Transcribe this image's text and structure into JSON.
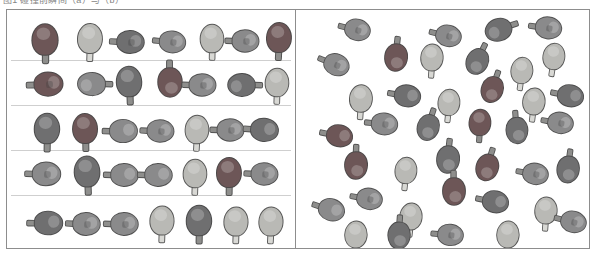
{
  "figure": {
    "caption": "图1  碰撞前瞬间（a）与（b）",
    "frame_color": "#8d8d8d",
    "background": "#ffffff",
    "row_rule_color": "#cfcfcf"
  },
  "palette": {
    "dark_maroon": "#6d5657",
    "dark_gray": "#6f6f70",
    "mid_gray": "#8a8a8b",
    "light_gray": "#b9b9b5",
    "pale_cream": "#c6c6c0",
    "handle_light": "#d8d8d4",
    "handle_dark": "#8e8e8c",
    "outline": "#464646"
  },
  "panels": [
    {
      "id": "ordered",
      "name": "ordered-arrangement-panel",
      "label": "a",
      "description": "paddles aligned in five horizontal rows",
      "row_count": 5,
      "row_rule_y": [
        50,
        95,
        140,
        185
      ],
      "paddle_count": 34,
      "paddles": [
        {
          "x": 38,
          "y": 29,
          "r": 0,
          "s": 1.05,
          "blade": "dark_maroon",
          "handle": "handle_dark",
          "logo": false
        },
        {
          "x": 83,
          "y": 28,
          "r": 2,
          "s": 1.0,
          "blade": "light_gray",
          "handle": "handle_light",
          "logo": false
        },
        {
          "x": 124,
          "y": 32,
          "r": 93,
          "s": 0.92,
          "blade": "dark_gray",
          "handle": "handle_dark",
          "logo": true
        },
        {
          "x": 166,
          "y": 32,
          "r": 96,
          "s": 0.88,
          "blade": "mid_gray",
          "handle": "handle_dark",
          "logo": true
        },
        {
          "x": 205,
          "y": 28,
          "r": 1,
          "s": 0.95,
          "blade": "light_gray",
          "handle": "handle_light",
          "logo": false
        },
        {
          "x": 239,
          "y": 31,
          "r": 92,
          "s": 0.9,
          "blade": "mid_gray",
          "handle": "handle_dark",
          "logo": true
        },
        {
          "x": 272,
          "y": 27,
          "r": 3,
          "s": 1.0,
          "blade": "dark_maroon",
          "handle": "handle_dark",
          "logo": false
        },
        {
          "x": 42,
          "y": 74,
          "r": 88,
          "s": 0.97,
          "blade": "dark_maroon",
          "handle": "handle_dark",
          "logo": true
        },
        {
          "x": 84,
          "y": 74,
          "r": 272,
          "s": 0.93,
          "blade": "mid_gray",
          "handle": "handle_dark",
          "logo": false
        },
        {
          "x": 122,
          "y": 71,
          "r": 358,
          "s": 1.02,
          "blade": "dark_gray",
          "handle": "handle_dark",
          "logo": false
        },
        {
          "x": 163,
          "y": 73,
          "r": 180,
          "s": 0.98,
          "blade": "dark_maroon",
          "handle": "handle_dark",
          "logo": false
        },
        {
          "x": 196,
          "y": 75,
          "r": 92,
          "s": 0.9,
          "blade": "mid_gray",
          "handle": "handle_dark",
          "logo": true
        },
        {
          "x": 234,
          "y": 75,
          "r": 272,
          "s": 0.92,
          "blade": "dark_gray",
          "handle": "handle_dark",
          "logo": false
        },
        {
          "x": 270,
          "y": 72,
          "r": 2,
          "s": 0.95,
          "blade": "light_gray",
          "handle": "handle_light",
          "logo": false
        },
        {
          "x": 40,
          "y": 118,
          "r": 1,
          "s": 1.02,
          "blade": "dark_gray",
          "handle": "handle_dark",
          "logo": false
        },
        {
          "x": 78,
          "y": 118,
          "r": 359,
          "s": 1.0,
          "blade": "dark_maroon",
          "handle": "handle_dark",
          "logo": false
        },
        {
          "x": 117,
          "y": 121,
          "r": 91,
          "s": 0.93,
          "blade": "mid_gray",
          "handle": "handle_dark",
          "logo": false
        },
        {
          "x": 154,
          "y": 121,
          "r": 93,
          "s": 0.9,
          "blade": "mid_gray",
          "handle": "handle_dark",
          "logo": true
        },
        {
          "x": 190,
          "y": 119,
          "r": 3,
          "s": 0.95,
          "blade": "light_gray",
          "handle": "handle_light",
          "logo": false
        },
        {
          "x": 224,
          "y": 120,
          "r": 92,
          "s": 0.9,
          "blade": "mid_gray",
          "handle": "handle_dark",
          "logo": true
        },
        {
          "x": 258,
          "y": 120,
          "r": 95,
          "s": 0.93,
          "blade": "dark_gray",
          "handle": "handle_dark",
          "logo": false
        },
        {
          "x": 40,
          "y": 164,
          "r": 92,
          "s": 0.95,
          "blade": "mid_gray",
          "handle": "handle_dark",
          "logo": true
        },
        {
          "x": 80,
          "y": 161,
          "r": 358,
          "s": 1.03,
          "blade": "dark_gray",
          "handle": "handle_dark",
          "logo": false
        },
        {
          "x": 118,
          "y": 165,
          "r": 92,
          "s": 0.92,
          "blade": "mid_gray",
          "handle": "handle_dark",
          "logo": false
        },
        {
          "x": 152,
          "y": 165,
          "r": 92,
          "s": 0.92,
          "blade": "mid_gray",
          "handle": "handle_dark",
          "logo": false
        },
        {
          "x": 188,
          "y": 163,
          "r": 2,
          "s": 0.95,
          "blade": "light_gray",
          "handle": "handle_light",
          "logo": false
        },
        {
          "x": 222,
          "y": 162,
          "r": 1,
          "s": 1.0,
          "blade": "dark_maroon",
          "handle": "handle_dark",
          "logo": false
        },
        {
          "x": 258,
          "y": 164,
          "r": 93,
          "s": 0.9,
          "blade": "mid_gray",
          "handle": "handle_dark",
          "logo": true
        },
        {
          "x": 42,
          "y": 213,
          "r": 91,
          "s": 0.95,
          "blade": "dark_gray",
          "handle": "handle_dark",
          "logo": false
        },
        {
          "x": 80,
          "y": 214,
          "r": 93,
          "s": 0.92,
          "blade": "mid_gray",
          "handle": "handle_dark",
          "logo": true
        },
        {
          "x": 118,
          "y": 214,
          "r": 92,
          "s": 0.92,
          "blade": "mid_gray",
          "handle": "handle_dark",
          "logo": true
        },
        {
          "x": 155,
          "y": 210,
          "r": 2,
          "s": 0.97,
          "blade": "light_gray",
          "handle": "handle_light",
          "logo": false
        },
        {
          "x": 192,
          "y": 210,
          "r": 1,
          "s": 1.02,
          "blade": "dark_gray",
          "handle": "handle_dark",
          "logo": false
        },
        {
          "x": 229,
          "y": 211,
          "r": 2,
          "s": 0.97,
          "blade": "light_gray",
          "handle": "handle_light",
          "logo": false
        },
        {
          "x": 264,
          "y": 211,
          "r": 3,
          "s": 0.97,
          "blade": "light_gray",
          "handle": "handle_light",
          "logo": false
        }
      ]
    },
    {
      "id": "random",
      "name": "random-arrangement-panel",
      "label": "b",
      "description": "paddles scattered with random positions and orientations",
      "row_count": 0,
      "row_rule_y": [],
      "paddle_count": 39,
      "paddles": [
        {
          "x": 62,
          "y": 20,
          "r": 104,
          "s": 0.86,
          "blade": "mid_gray",
          "handle": "handle_dark",
          "logo": true
        },
        {
          "x": 153,
          "y": 26,
          "r": 104,
          "s": 0.86,
          "blade": "mid_gray",
          "handle": "handle_dark",
          "logo": true
        },
        {
          "x": 202,
          "y": 20,
          "r": 252,
          "s": 0.9,
          "blade": "dark_gray",
          "handle": "handle_dark",
          "logo": false
        },
        {
          "x": 253,
          "y": 18,
          "r": 98,
          "s": 0.88,
          "blade": "mid_gray",
          "handle": "handle_dark",
          "logo": true
        },
        {
          "x": 100,
          "y": 48,
          "r": 186,
          "s": 0.92,
          "blade": "dark_maroon",
          "handle": "handle_dark",
          "logo": false
        },
        {
          "x": 136,
          "y": 47,
          "r": 4,
          "s": 0.9,
          "blade": "light_gray",
          "handle": "handle_light",
          "logo": false
        },
        {
          "x": 41,
          "y": 55,
          "r": 112,
          "s": 0.86,
          "blade": "mid_gray",
          "handle": "handle_dark",
          "logo": true
        },
        {
          "x": 181,
          "y": 52,
          "r": 206,
          "s": 0.88,
          "blade": "dark_gray",
          "handle": "handle_dark",
          "logo": false
        },
        {
          "x": 226,
          "y": 60,
          "r": 8,
          "s": 0.88,
          "blade": "light_gray",
          "handle": "handle_light",
          "logo": false
        },
        {
          "x": 258,
          "y": 46,
          "r": 9,
          "s": 0.88,
          "blade": "light_gray",
          "handle": "handle_light",
          "logo": false
        },
        {
          "x": 65,
          "y": 88,
          "r": 4,
          "s": 0.92,
          "blade": "light_gray",
          "handle": "handle_light",
          "logo": false
        },
        {
          "x": 112,
          "y": 86,
          "r": 100,
          "s": 0.88,
          "blade": "dark_gray",
          "handle": "handle_dark",
          "logo": false
        },
        {
          "x": 153,
          "y": 92,
          "r": 6,
          "s": 0.88,
          "blade": "light_gray",
          "handle": "handle_light",
          "logo": false
        },
        {
          "x": 196,
          "y": 80,
          "r": 200,
          "s": 0.88,
          "blade": "dark_maroon",
          "handle": "handle_dark",
          "logo": false
        },
        {
          "x": 238,
          "y": 91,
          "r": 7,
          "s": 0.9,
          "blade": "light_gray",
          "handle": "handle_light",
          "logo": false
        },
        {
          "x": 275,
          "y": 86,
          "r": 102,
          "s": 0.88,
          "blade": "dark_gray",
          "handle": "handle_dark",
          "logo": false
        },
        {
          "x": 89,
          "y": 114,
          "r": 96,
          "s": 0.88,
          "blade": "mid_gray",
          "handle": "handle_dark",
          "logo": true
        },
        {
          "x": 132,
          "y": 118,
          "r": 198,
          "s": 0.88,
          "blade": "dark_gray",
          "handle": "handle_dark",
          "logo": false
        },
        {
          "x": 184,
          "y": 112,
          "r": 4,
          "s": 0.88,
          "blade": "dark_maroon",
          "handle": "handle_dark",
          "logo": false
        },
        {
          "x": 221,
          "y": 121,
          "r": 176,
          "s": 0.88,
          "blade": "dark_gray",
          "handle": "handle_dark",
          "logo": false
        },
        {
          "x": 265,
          "y": 113,
          "r": 100,
          "s": 0.86,
          "blade": "mid_gray",
          "handle": "handle_dark",
          "logo": true
        },
        {
          "x": 44,
          "y": 126,
          "r": 102,
          "s": 0.88,
          "blade": "dark_maroon",
          "handle": "handle_dark",
          "logo": false
        },
        {
          "x": 60,
          "y": 156,
          "r": 182,
          "s": 0.92,
          "blade": "dark_maroon",
          "handle": "handle_dark",
          "logo": false
        },
        {
          "x": 110,
          "y": 160,
          "r": 6,
          "s": 0.88,
          "blade": "light_gray",
          "handle": "handle_light",
          "logo": false
        },
        {
          "x": 152,
          "y": 150,
          "r": 186,
          "s": 0.92,
          "blade": "dark_gray",
          "handle": "handle_dark",
          "logo": false
        },
        {
          "x": 191,
          "y": 158,
          "r": 198,
          "s": 0.9,
          "blade": "dark_maroon",
          "handle": "handle_dark",
          "logo": false
        },
        {
          "x": 240,
          "y": 164,
          "r": 100,
          "s": 0.86,
          "blade": "mid_gray",
          "handle": "handle_dark",
          "logo": true
        },
        {
          "x": 272,
          "y": 160,
          "r": 188,
          "s": 0.9,
          "blade": "dark_gray",
          "handle": "handle_dark",
          "logo": false
        },
        {
          "x": 74,
          "y": 189,
          "r": 100,
          "s": 0.86,
          "blade": "mid_gray",
          "handle": "handle_dark",
          "logo": true
        },
        {
          "x": 158,
          "y": 182,
          "r": 180,
          "s": 0.92,
          "blade": "dark_maroon",
          "handle": "handle_dark",
          "logo": false
        },
        {
          "x": 200,
          "y": 192,
          "r": 102,
          "s": 0.88,
          "blade": "dark_gray",
          "handle": "handle_dark",
          "logo": false
        },
        {
          "x": 36,
          "y": 200,
          "r": 108,
          "s": 0.88,
          "blade": "mid_gray",
          "handle": "handle_dark",
          "logo": false
        },
        {
          "x": 115,
          "y": 206,
          "r": 6,
          "s": 0.9,
          "blade": "light_gray",
          "handle": "handle_light",
          "logo": false
        },
        {
          "x": 250,
          "y": 200,
          "r": 4,
          "s": 0.9,
          "blade": "light_gray",
          "handle": "handle_light",
          "logo": false
        },
        {
          "x": 278,
          "y": 212,
          "r": 104,
          "s": 0.86,
          "blade": "mid_gray",
          "handle": "handle_dark",
          "logo": true
        },
        {
          "x": 60,
          "y": 224,
          "r": 4,
          "s": 0.9,
          "blade": "light_gray",
          "handle": "handle_light",
          "logo": false
        },
        {
          "x": 103,
          "y": 226,
          "r": 184,
          "s": 0.9,
          "blade": "dark_gray",
          "handle": "handle_dark",
          "logo": false
        },
        {
          "x": 155,
          "y": 225,
          "r": 96,
          "s": 0.86,
          "blade": "mid_gray",
          "handle": "handle_dark",
          "logo": true
        },
        {
          "x": 212,
          "y": 224,
          "r": 4,
          "s": 0.9,
          "blade": "light_gray",
          "handle": "handle_light",
          "logo": false
        }
      ]
    }
  ]
}
